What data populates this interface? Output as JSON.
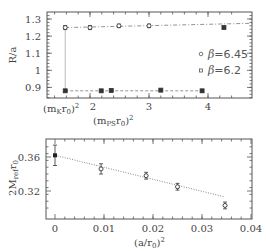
{
  "chart_data": [
    {
      "type": "scatter",
      "title": "",
      "xlabel": "(m_PS r_0)^2",
      "ylabel": "R/a",
      "xlim": [
        1.2,
        4.7
      ],
      "ylim": [
        0.83,
        1.35
      ],
      "xticks": [
        2,
        3,
        4
      ],
      "xtick_labels": [
        "2",
        "3",
        "4"
      ],
      "yticks": [
        0.9,
        1.0,
        1.1,
        1.2,
        1.3
      ],
      "ytick_labels": [
        "0.9",
        "1",
        "1.1",
        "1.2",
        "1.3"
      ],
      "special_xtick": {
        "x": 1.58,
        "label": "(m_K r_0)^2"
      },
      "vertical_line_x": 1.58,
      "legend": [
        {
          "label": "β=6.45",
          "marker": "circle"
        },
        {
          "label": "β=6.2",
          "marker": "square"
        }
      ],
      "legend_position": "right-middle",
      "series": [
        {
          "name": "β=6.45",
          "marker": "circle",
          "x": [
            1.58,
            2.0,
            2.49,
            3.0
          ],
          "y": [
            1.25,
            1.25,
            1.26,
            1.26
          ],
          "yerr": [
            0.012,
            0.012,
            0.01,
            0.01
          ],
          "fit_line": {
            "style": "dash-dot",
            "x": [
              1.58,
              4.7
            ],
            "y": [
              1.25,
              1.275
            ]
          }
        },
        {
          "name": "β=6.2",
          "marker": "square",
          "x": [
            1.58,
            2.19,
            2.36,
            3.2,
            3.9,
            4.27
          ],
          "y": [
            0.88,
            0.88,
            0.882,
            0.884,
            0.88,
            1.25
          ],
          "note": "last point (x=4.27,y=1.25) belongs to upper band",
          "fit_line": {
            "style": "dashed",
            "x": [
              1.58,
              3.9
            ],
            "y": [
              0.88,
              0.88
            ]
          }
        }
      ],
      "grid": false
    },
    {
      "type": "scatter",
      "title": "",
      "xlabel": "(a/r_0)^2",
      "ylabel": "2M_ref r_0",
      "xlim": [
        -0.004,
        0.04
      ],
      "ylim": [
        0.297,
        0.38
      ],
      "xticks": [
        0,
        0.01,
        0.02,
        0.03,
        0.04
      ],
      "xtick_labels": [
        "0",
        "0.01",
        "0.02",
        "0.03",
        "0.04"
      ],
      "yticks": [
        0.32,
        0.36
      ],
      "ytick_labels": [
        "0.32",
        "0.36"
      ],
      "series": [
        {
          "name": "data",
          "marker": "circle",
          "x": [
            0.0094,
            0.0186,
            0.025,
            0.0347
          ],
          "y": [
            0.346,
            0.338,
            0.325,
            0.303
          ],
          "yerr": [
            0.006,
            0.004,
            0.004,
            0.004
          ]
        },
        {
          "name": "continuum extrapolation",
          "marker": "filled-square",
          "x": [
            0.0
          ],
          "y": [
            0.362
          ],
          "yerr": [
            0.012
          ]
        }
      ],
      "fit_line": {
        "style": "dotted",
        "x": [
          0.0,
          0.0347
        ],
        "y": [
          0.362,
          0.313
        ]
      },
      "grid": false
    }
  ],
  "top": {
    "ylabel": "R/a",
    "xlabel_main": "(m",
    "xlabel_sub": "PS",
    "xlabel_mid": "r",
    "xlabel_sub2": "0",
    "xlabel_end": ")",
    "xlabel_sup": "2",
    "mk_label_a": "(m",
    "mk_label_sub": "K",
    "mk_label_b": "r",
    "mk_label_sub2": "0",
    "mk_label_c": ")",
    "mk_label_sup": "2",
    "legend": [
      {
        "beta": "β",
        "value": "=6.45"
      },
      {
        "beta": "β",
        "value": "=6.2"
      }
    ]
  },
  "bottom": {
    "ylabel_a": "2M",
    "ylabel_sub": "ref",
    "ylabel_b": "r",
    "ylabel_sub2": "0",
    "xlabel_a": "(a/r",
    "xlabel_sub": "0",
    "xlabel_b": ")",
    "xlabel_sup": "2"
  },
  "colors": {
    "axes": "#555555",
    "markers": "#333333",
    "fit": "#888888",
    "text": "#444444"
  }
}
